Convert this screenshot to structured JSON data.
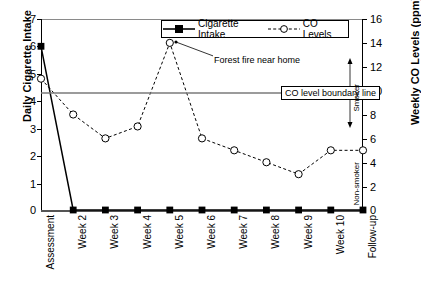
{
  "chart_data": {
    "type": "line",
    "title": "",
    "categories": [
      "Assessment",
      "Week 2",
      "Week 3",
      "Week 4",
      "Week 5",
      "Week 6",
      "Week 7",
      "Week 8",
      "Week 9",
      "Week 10",
      "Follow-up"
    ],
    "series": [
      {
        "name": "Cigarette Intake",
        "axis": "left",
        "marker": "filled-square",
        "line": "solid",
        "values": [
          6,
          0,
          0,
          0,
          0,
          0,
          0,
          0,
          0,
          0,
          0
        ]
      },
      {
        "name": "CO Levels",
        "axis": "right",
        "marker": "open-circle",
        "line": "dashed",
        "values": [
          11,
          8,
          6,
          7,
          14,
          6,
          5,
          4,
          3,
          5,
          5
        ]
      }
    ],
    "ylabel": "Daily Cigarette Intake",
    "y2label": "Weekly CO Levels (ppm)",
    "xlabel": "",
    "ylim": [
      0,
      7
    ],
    "y2lim": [
      0,
      16
    ],
    "yticks": [
      0,
      1,
      2,
      3,
      4,
      5,
      6,
      7
    ],
    "y2ticks": [
      0,
      2,
      4,
      6,
      8,
      10,
      12,
      14,
      16
    ],
    "grid": false,
    "legend_position": "top-center",
    "reference_lines": [
      {
        "label": "CO level boundary line",
        "value_ppm": 10,
        "axis": "right"
      }
    ],
    "annotations": [
      {
        "text": "Forest fire near home",
        "points_to": "Week 5"
      },
      {
        "text": "Smoker",
        "orientation": "vertical",
        "position": "above-boundary"
      },
      {
        "text": "Non-smoker",
        "orientation": "vertical",
        "position": "below-boundary"
      }
    ]
  },
  "legend": {
    "items": [
      {
        "label": "Cigarette Intake"
      },
      {
        "label": "CO Levels"
      }
    ]
  },
  "axes": {
    "left_title": "Daily Cigarette Intake",
    "right_title": "Weekly CO Levels (ppm)",
    "left_ticks": [
      "7",
      "6",
      "5",
      "4",
      "3",
      "2",
      "1",
      "0"
    ],
    "right_ticks": [
      "16",
      "14",
      "12",
      "10",
      "8",
      "6",
      "4",
      "2",
      "0"
    ]
  },
  "annotations": {
    "boundary": "CO level boundary line",
    "fire": "Forest fire near home",
    "smoker": "Smoker",
    "nonsmoker": "Non-smoker"
  }
}
